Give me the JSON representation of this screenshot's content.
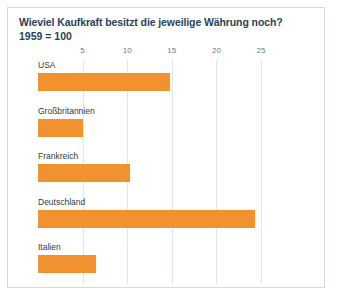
{
  "card": {
    "border_color": "#cfdcdc",
    "background": "#ffffff"
  },
  "header": {
    "title": "Wieviel Kaufkraft besitzt die jeweilige Währung noch?",
    "subtitle": "1959 = 100"
  },
  "chart_data": {
    "type": "bar",
    "orientation": "horizontal",
    "title": "Wieviel Kaufkraft besitzt die jeweilige Währung noch?",
    "subtitle": "1959 = 100",
    "xlabel": "",
    "ylabel": "",
    "categories": [
      "USA",
      "Großbritannien",
      "Frankreich",
      "Deutschland",
      "Italien"
    ],
    "values": [
      14.8,
      5.0,
      10.3,
      24.3,
      6.5
    ],
    "xlim": [
      0,
      27.5
    ],
    "ticks": [
      5,
      10,
      15,
      20,
      25
    ],
    "tick_labels": [
      "5",
      "10",
      "15",
      "20",
      "25"
    ],
    "grid": true,
    "legend": false,
    "bar_color": "#f2912f",
    "title_color": "#2b4255",
    "gridline_color": "#dfe6e6",
    "tick_label_color": "#6d7b86"
  }
}
